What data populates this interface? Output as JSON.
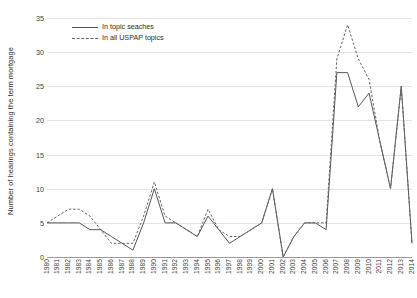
{
  "chart_data": {
    "type": "line",
    "title": "",
    "xlabel": "",
    "ylabel": "Number of hearings containing the term mortgage",
    "ylim": [
      0,
      35
    ],
    "yticks": [
      0,
      5,
      10,
      15,
      20,
      25,
      30,
      35
    ],
    "grid": true,
    "legend_position": "top-left-inside",
    "categories": [
      "1980",
      "1981",
      "1982",
      "1983",
      "1984",
      "1985",
      "1986",
      "1987",
      "1988",
      "1989",
      "1990",
      "1991",
      "1992",
      "1993",
      "1994",
      "1995",
      "1996",
      "1997",
      "1998",
      "1999",
      "2000",
      "2001",
      "2002",
      "2003",
      "2004",
      "2005",
      "2006",
      "2007",
      "2008",
      "2009",
      "2010",
      "2011",
      "2012",
      "2013",
      "2014"
    ],
    "series": [
      {
        "name": "In topic seaches",
        "style": "solid",
        "color": "#555555",
        "values": [
          5,
          5,
          5,
          5,
          4,
          4,
          3,
          2,
          1,
          5,
          10,
          5,
          5,
          4,
          3,
          6,
          4,
          2,
          3,
          4,
          5,
          10,
          0,
          3,
          5,
          5,
          4,
          27,
          27,
          22,
          24,
          17,
          10,
          25,
          2
        ]
      },
      {
        "name": "In all USPAP topics",
        "style": "dashed",
        "color": "#666666",
        "values": [
          5,
          6,
          7,
          7,
          6,
          4,
          2,
          2,
          2,
          6,
          11,
          6,
          5,
          4,
          3,
          7,
          4,
          3,
          3,
          4,
          5,
          10,
          0,
          3,
          5,
          5,
          5,
          29,
          34,
          29,
          26,
          17,
          10,
          25,
          2
        ]
      }
    ]
  },
  "axis": {
    "y_title": "Number of hearings containing the term mortgage"
  },
  "legend": {
    "items": [
      {
        "label": "In topic seaches"
      },
      {
        "label": "In all USPAP topics"
      }
    ]
  },
  "colors": {
    "grid": "#e3e3e3",
    "axis": "#9a9a9a",
    "series_solid": "#555555",
    "series_dashed": "#666666",
    "text": "#2b2b2b"
  }
}
